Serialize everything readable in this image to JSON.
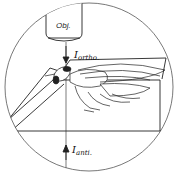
{
  "diagram": {
    "type": "schematic illustration",
    "labels": {
      "objective": "Obj.",
      "ortho_symbol": "I",
      "ortho_subscript": "ortho.",
      "anti_symbol": "I",
      "anti_subscript": "anti."
    },
    "components": [
      {
        "name": "field-of-view-circle",
        "description": "circular microscope field outline"
      },
      {
        "name": "objective",
        "label": "Obj."
      },
      {
        "name": "orthodromic-arrow",
        "direction": "down",
        "label": "I ortho."
      },
      {
        "name": "antidromic-arrow",
        "direction": "up",
        "label": "I anti."
      },
      {
        "name": "mounting-block",
        "description": "rectangular block supporting the insect"
      },
      {
        "name": "insect",
        "description": "fly with wings, legs underneath"
      },
      {
        "name": "electrode",
        "description": "diagonal tapered electrode from lower left"
      }
    ],
    "colors": {
      "line": "#222222",
      "background": "#ffffff"
    }
  }
}
